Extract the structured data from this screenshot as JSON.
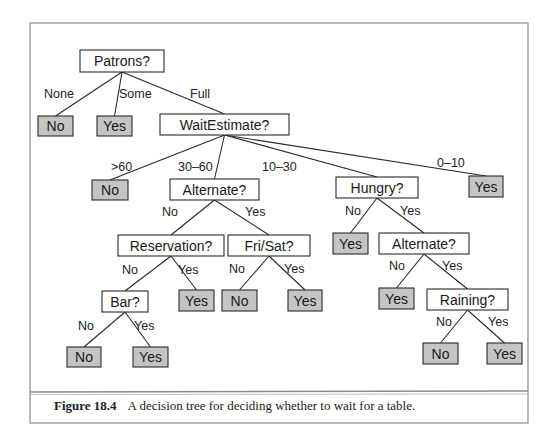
{
  "figure": {
    "caption_number": "Figure 18.4",
    "caption_text": "A decision tree for deciding whether to wait for a table."
  },
  "colors": {
    "leaf_fill": "#c4c4c4",
    "node_fill": "#ffffff",
    "stroke": "#2a2a2a",
    "frame": "#8a8a8a"
  },
  "tree": {
    "nodes": [
      {
        "id": "patrons",
        "label": "Patrons?",
        "type": "attribute",
        "x": 80,
        "y": 50,
        "w": 84,
        "h": 22
      },
      {
        "id": "leaf-none",
        "label": "No",
        "type": "leaf",
        "x": 38,
        "y": 116,
        "w": 35,
        "h": 20
      },
      {
        "id": "leaf-some",
        "label": "Yes",
        "type": "leaf",
        "x": 97,
        "y": 116,
        "w": 35,
        "h": 20
      },
      {
        "id": "waitestimate",
        "label": "WaitEstimate?",
        "type": "attribute",
        "x": 160,
        "y": 114,
        "w": 129,
        "h": 21
      },
      {
        "id": "leaf-gt60",
        "label": "No",
        "type": "leaf",
        "x": 92,
        "y": 180,
        "w": 36,
        "h": 20
      },
      {
        "id": "alternate1",
        "label": "Alternate?",
        "type": "attribute",
        "x": 170,
        "y": 179,
        "w": 89,
        "h": 21
      },
      {
        "id": "hungry",
        "label": "Hungry?",
        "type": "attribute",
        "x": 336,
        "y": 177,
        "w": 82,
        "h": 21
      },
      {
        "id": "leaf-0-10",
        "label": "Yes",
        "type": "leaf",
        "x": 469,
        "y": 176,
        "w": 34,
        "h": 21
      },
      {
        "id": "reservation",
        "label": "Reservation?",
        "type": "attribute",
        "x": 118,
        "y": 235,
        "w": 106,
        "h": 21
      },
      {
        "id": "frisat",
        "label": "Fri/Sat?",
        "type": "attribute",
        "x": 228,
        "y": 235,
        "w": 82,
        "h": 21
      },
      {
        "id": "leaf-hungry-no",
        "label": "Yes",
        "type": "leaf",
        "x": 333,
        "y": 233,
        "w": 35,
        "h": 21
      },
      {
        "id": "alternate2",
        "label": "Alternate?",
        "type": "attribute",
        "x": 379,
        "y": 233,
        "w": 90,
        "h": 21
      },
      {
        "id": "bar",
        "label": "Bar?",
        "type": "attribute",
        "x": 102,
        "y": 291,
        "w": 46,
        "h": 21
      },
      {
        "id": "leaf-res-yes",
        "label": "Yes",
        "type": "leaf",
        "x": 179,
        "y": 290,
        "w": 35,
        "h": 21
      },
      {
        "id": "leaf-frisat-no",
        "label": "No",
        "type": "leaf",
        "x": 222,
        "y": 290,
        "w": 35,
        "h": 21
      },
      {
        "id": "leaf-frisat-yes",
        "label": "Yes",
        "type": "leaf",
        "x": 288,
        "y": 290,
        "w": 34,
        "h": 21
      },
      {
        "id": "leaf-alt2-no",
        "label": "Yes",
        "type": "leaf",
        "x": 379,
        "y": 288,
        "w": 35,
        "h": 21
      },
      {
        "id": "raining",
        "label": "Raining?",
        "type": "attribute",
        "x": 427,
        "y": 289,
        "w": 81,
        "h": 21
      },
      {
        "id": "leaf-bar-no",
        "label": "No",
        "type": "leaf",
        "x": 67,
        "y": 347,
        "w": 34,
        "h": 20
      },
      {
        "id": "leaf-bar-yes",
        "label": "Yes",
        "type": "leaf",
        "x": 133,
        "y": 347,
        "w": 35,
        "h": 20
      },
      {
        "id": "leaf-rain-no",
        "label": "No",
        "type": "leaf",
        "x": 423,
        "y": 343,
        "w": 35,
        "h": 21
      },
      {
        "id": "leaf-rain-yes",
        "label": "Yes",
        "type": "leaf",
        "x": 487,
        "y": 343,
        "w": 35,
        "h": 21
      }
    ],
    "edges": [
      {
        "from": "patrons",
        "to": "leaf-none",
        "label": "None",
        "lx": 44,
        "ly": 98
      },
      {
        "from": "patrons",
        "to": "leaf-some",
        "label": "Some",
        "lx": 119,
        "ly": 98
      },
      {
        "from": "patrons",
        "to": "waitestimate",
        "label": "Full",
        "lx": 190,
        "ly": 98
      },
      {
        "from": "waitestimate",
        "to": "leaf-gt60",
        "label": ">60",
        "lx": 111,
        "ly": 171
      },
      {
        "from": "waitestimate",
        "to": "alternate1",
        "label": "30–60",
        "lx": 178,
        "ly": 171
      },
      {
        "from": "waitestimate",
        "to": "hungry",
        "label": "10–30",
        "lx": 262,
        "ly": 171
      },
      {
        "from": "waitestimate",
        "to": "leaf-0-10",
        "label": "0–10",
        "lx": 437,
        "ly": 167
      },
      {
        "from": "alternate1",
        "to": "reservation",
        "label": "No",
        "lx": 162,
        "ly": 216
      },
      {
        "from": "alternate1",
        "to": "frisat",
        "label": "Yes",
        "lx": 245,
        "ly": 216
      },
      {
        "from": "hungry",
        "to": "leaf-hungry-no",
        "label": "No",
        "lx": 345,
        "ly": 215
      },
      {
        "from": "hungry",
        "to": "alternate2",
        "label": "Yes",
        "lx": 400,
        "ly": 215
      },
      {
        "from": "reservation",
        "to": "bar",
        "label": "No",
        "lx": 122,
        "ly": 274
      },
      {
        "from": "reservation",
        "to": "leaf-res-yes",
        "label": "Yes",
        "lx": 178,
        "ly": 274
      },
      {
        "from": "frisat",
        "to": "leaf-frisat-no",
        "label": "No",
        "lx": 229,
        "ly": 273
      },
      {
        "from": "frisat",
        "to": "leaf-frisat-yes",
        "label": "Yes",
        "lx": 284,
        "ly": 273
      },
      {
        "from": "alternate2",
        "to": "leaf-alt2-no",
        "label": "No",
        "lx": 389,
        "ly": 270
      },
      {
        "from": "alternate2",
        "to": "raining",
        "label": "Yes",
        "lx": 442,
        "ly": 270
      },
      {
        "from": "bar",
        "to": "leaf-bar-no",
        "label": "No",
        "lx": 78,
        "ly": 330
      },
      {
        "from": "bar",
        "to": "leaf-bar-yes",
        "label": "Yes",
        "lx": 134,
        "ly": 330
      },
      {
        "from": "raining",
        "to": "leaf-rain-no",
        "label": "No",
        "lx": 436,
        "ly": 326
      },
      {
        "from": "raining",
        "to": "leaf-rain-yes",
        "label": "Yes",
        "lx": 488,
        "ly": 326
      }
    ]
  }
}
